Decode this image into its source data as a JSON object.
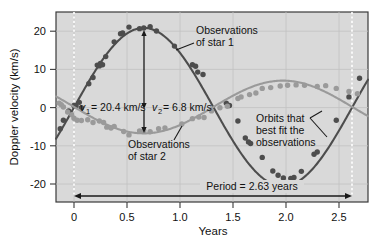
{
  "chart_data": {
    "type": "scatter",
    "title": "",
    "xlabel": "Years",
    "ylabel": "Doppler velocity (km/s)",
    "xlim": [
      -0.17,
      2.78
    ],
    "ylim": [
      -24.5,
      24.5
    ],
    "xticks": [
      "0",
      "0.5",
      "1.0",
      "1.5",
      "2.0",
      "2.5"
    ],
    "xtick_values": [
      0,
      0.5,
      1.0,
      1.5,
      2.0,
      2.5
    ],
    "yticks": [
      "20",
      "10",
      "0",
      "-10",
      "-20"
    ],
    "ytick_values": [
      20,
      10,
      0,
      -10,
      -20
    ],
    "grid": true,
    "legend": "none",
    "plot_bg": "#d9d9d9",
    "series": [
      {
        "name": "Observations of star 1",
        "color": "#4d4d4d",
        "amplitude": 20.4,
        "period": 2.63,
        "mean": 0.8,
        "phase_peak": 0.66,
        "points": [
          [
            -0.13,
            -5.6
          ],
          [
            -0.1,
            -3.4
          ],
          [
            -0.05,
            -1.0
          ],
          [
            0.0,
            0.4
          ],
          [
            0.02,
            0.3
          ],
          [
            0.05,
            1.2
          ],
          [
            0.07,
            -0.2
          ],
          [
            0.14,
            6.0
          ],
          [
            0.18,
            7.6
          ],
          [
            0.22,
            10.8
          ],
          [
            0.24,
            10.6
          ],
          [
            0.25,
            11.2
          ],
          [
            0.27,
            10.9
          ],
          [
            0.3,
            13.0
          ],
          [
            0.38,
            16.8
          ],
          [
            0.44,
            18.9
          ],
          [
            0.46,
            19.1
          ],
          [
            0.52,
            20.6
          ],
          [
            0.62,
            20.2
          ],
          [
            0.66,
            20.4
          ],
          [
            0.72,
            20.7
          ],
          [
            0.78,
            19.6
          ],
          [
            0.95,
            15.7
          ],
          [
            1.12,
            10.9
          ],
          [
            1.15,
            10.5
          ],
          [
            1.17,
            9.0
          ],
          [
            1.22,
            8.4
          ],
          [
            1.44,
            1.0
          ],
          [
            1.47,
            0.4
          ],
          [
            1.55,
            -3.6
          ],
          [
            1.62,
            -8.0
          ],
          [
            1.65,
            -9.0
          ],
          [
            1.67,
            -9.4
          ],
          [
            1.78,
            -13.0
          ],
          [
            1.88,
            -16.5
          ],
          [
            1.93,
            -17.6
          ],
          [
            1.98,
            -18.3
          ],
          [
            2.05,
            -18.4
          ],
          [
            2.08,
            -18.2
          ],
          [
            2.15,
            -16.6
          ],
          [
            2.27,
            -12.2
          ],
          [
            2.3,
            -11.6
          ],
          [
            2.48,
            -3.4
          ],
          [
            2.6,
            2.6
          ],
          [
            2.7,
            7.4
          ]
        ]
      },
      {
        "name": "Observations of star 2",
        "color": "#9a9a9a",
        "amplitude": 6.8,
        "period": 2.63,
        "mean": 0.8,
        "phase_trough": 0.66,
        "points": [
          [
            -0.14,
            1.0
          ],
          [
            -0.12,
            0.6
          ],
          [
            -0.1,
            0.0
          ],
          [
            -0.06,
            -1.3
          ],
          [
            -0.02,
            -2.0
          ],
          [
            0.0,
            -2.9
          ],
          [
            0.03,
            -3.4
          ],
          [
            0.07,
            -3.5
          ],
          [
            0.13,
            -3.3
          ],
          [
            0.18,
            -4.0
          ],
          [
            0.24,
            -3.6
          ],
          [
            0.28,
            -4.0
          ],
          [
            0.31,
            -5.2
          ],
          [
            0.35,
            -5.4
          ],
          [
            0.38,
            -5.0
          ],
          [
            0.47,
            -6.3
          ],
          [
            0.52,
            -7.2
          ],
          [
            0.62,
            -6.2
          ],
          [
            0.66,
            -6.1
          ],
          [
            0.72,
            -6.4
          ],
          [
            0.8,
            -5.6
          ],
          [
            0.86,
            -5.4
          ],
          [
            1.02,
            -4.4
          ],
          [
            1.12,
            -3.0
          ],
          [
            1.18,
            -2.6
          ],
          [
            1.23,
            -2.7
          ],
          [
            1.3,
            -1.0
          ],
          [
            1.38,
            -0.2
          ],
          [
            1.45,
            0.2
          ],
          [
            1.55,
            2.2
          ],
          [
            1.58,
            2.6
          ],
          [
            1.66,
            3.2
          ],
          [
            1.72,
            3.6
          ],
          [
            1.78,
            4.8
          ],
          [
            1.86,
            5.0
          ],
          [
            1.95,
            5.4
          ],
          [
            2.02,
            5.6
          ],
          [
            2.1,
            5.7
          ],
          [
            2.18,
            5.6
          ],
          [
            2.3,
            5.3
          ],
          [
            2.38,
            5.5
          ],
          [
            2.48,
            4.8
          ],
          [
            2.6,
            4.0
          ],
          [
            2.68,
            3.4
          ]
        ]
      }
    ],
    "annotations": [
      {
        "id": "obs-star-1",
        "line1": "Observations",
        "line2": "of star 1"
      },
      {
        "id": "obs-star-2",
        "line1": "Observations",
        "line2": "of star 2"
      },
      {
        "id": "best-fit",
        "line1": "Orbits that",
        "line2": "best fit the",
        "line3": "observations"
      },
      {
        "id": "v1",
        "symbol": "v",
        "sub": "1",
        "value": "= 20.4 km/s"
      },
      {
        "id": "v2",
        "symbol": "v",
        "sub": "2",
        "value": "= 6.8 km/s"
      },
      {
        "id": "period",
        "text": "Period = 2.63 years"
      }
    ]
  }
}
